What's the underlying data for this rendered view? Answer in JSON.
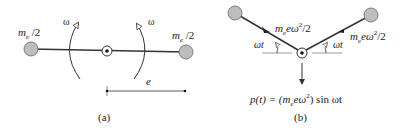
{
  "figure_a": {
    "caption": "(a)",
    "left_mass_label": "m",
    "left_mass_sub": "e",
    "left_mass_suffix": " /2",
    "right_mass_label": "m",
    "right_mass_sub": "e",
    "right_mass_suffix": " /2",
    "omega_left": "ω",
    "omega_right": "ω",
    "dimension_label": "e"
  },
  "figure_b": {
    "caption": "(b)",
    "left_force_m": "m",
    "left_force_sub": "e",
    "left_force_rest": "eω",
    "left_force_sup": "2",
    "left_force_tail": "/2",
    "right_force_m": "m",
    "right_force_sub": "e",
    "right_force_rest": "eω",
    "right_force_sup": "2",
    "right_force_tail": "/2",
    "angle_left": "ωt",
    "angle_right": "ωt",
    "formula_pre": "p(t) = (m",
    "formula_sub": "e",
    "formula_mid": "eω",
    "formula_sup": "2",
    "formula_post": ") sin ωt"
  },
  "colors": {
    "mass_fill": "#bdbdbd",
    "line": "#333333"
  }
}
